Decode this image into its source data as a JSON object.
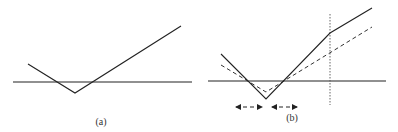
{
  "figures": [
    {
      "id": "a",
      "caption": "(a)",
      "caption_pos": {
        "x": 101,
        "y": 116
      },
      "axis": {
        "x1": 13,
        "x2": 192,
        "y": 82
      },
      "solid_line": [
        [
          28,
          64
        ],
        [
          75,
          93
        ],
        [
          181,
          26
        ]
      ]
    },
    {
      "id": "b",
      "caption": "(b)",
      "caption_pos": {
        "x": 292,
        "y": 112
      },
      "axis": {
        "x1": 208,
        "x2": 386,
        "y": 81
      },
      "solid_line": [
        [
          221,
          54
        ],
        [
          266,
          99
        ],
        [
          330,
          33
        ],
        [
          372,
          8
        ]
      ],
      "dashed_line": [
        [
          221,
          65
        ],
        [
          266,
          92
        ],
        [
          372,
          27
        ]
      ],
      "vertical_dotted": {
        "x": 330,
        "y1": 14,
        "y2": 105
      },
      "arrows": [
        {
          "x1": 236,
          "x2": 262,
          "y": 107
        },
        {
          "x1": 272,
          "x2": 297,
          "y": 107
        }
      ]
    }
  ],
  "colors": {
    "line": "#222222",
    "dashed": "#333333",
    "dotted": "#555555"
  }
}
